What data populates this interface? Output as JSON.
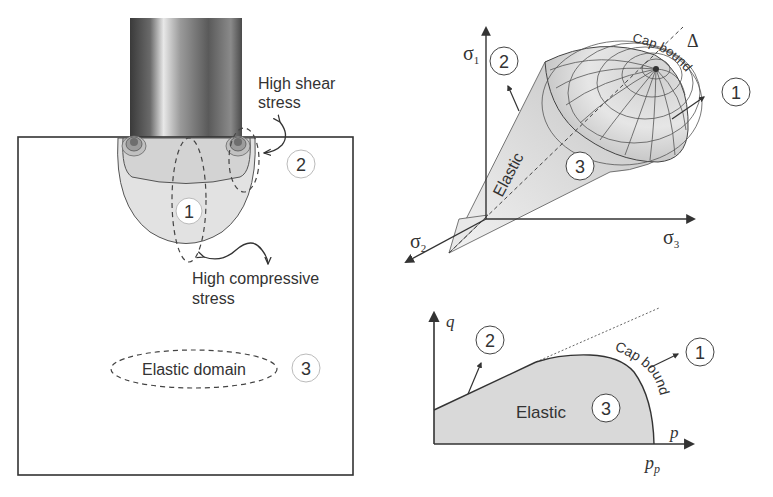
{
  "left_panel": {
    "shear_label_line1": "High shear",
    "shear_label_line2": "stress",
    "compressive_label_line1": "High compressive",
    "compressive_label_line2": "stress",
    "elastic_domain_label": "Elastic domain",
    "region_markers": [
      "1",
      "2",
      "3"
    ]
  },
  "cone_panel": {
    "axis_sigma1": "σ",
    "axis_sigma1_sub": "1",
    "axis_sigma2": "σ",
    "axis_sigma2_sub": "2",
    "axis_sigma3": "σ",
    "axis_sigma3_sub": "3",
    "hydrostatic_axis_label": "Δ",
    "cap_label": "Cap bound",
    "elastic_label": "Elastic",
    "region_markers": [
      "2",
      "1",
      "3"
    ]
  },
  "pq_panel": {
    "y_axis_label": "q",
    "x_axis_label": "p",
    "pp_label": "p",
    "pp_sub": "p",
    "elastic_label": "Elastic",
    "cap_label": "Cap bound",
    "region_markers": [
      "2",
      "1",
      "3"
    ]
  }
}
